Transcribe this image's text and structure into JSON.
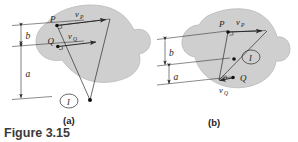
{
  "figure": {
    "caption": "Figure 3.15",
    "panels": [
      {
        "id": "a",
        "sublabel": "(a)",
        "points": [
          {
            "name": "P",
            "label": "P"
          },
          {
            "name": "Q",
            "label": "Q"
          }
        ],
        "vectors": [
          {
            "name": "vP",
            "base": "v",
            "subscript": "P"
          },
          {
            "name": "vQ",
            "base": "v",
            "subscript": "Q"
          }
        ],
        "dimensions": [
          {
            "name": "b",
            "label": "b"
          },
          {
            "name": "a",
            "label": "a"
          }
        ],
        "center": {
          "label": "I",
          "name": "instantaneous-center"
        }
      },
      {
        "id": "b",
        "sublabel": "(b)",
        "points": [
          {
            "name": "P",
            "label": "P"
          },
          {
            "name": "Q",
            "label": "Q"
          }
        ],
        "vectors": [
          {
            "name": "vP",
            "base": "v",
            "subscript": "P"
          },
          {
            "name": "vQ",
            "base": "v",
            "subscript": "Q"
          }
        ],
        "dimensions": [
          {
            "name": "b",
            "label": "b"
          },
          {
            "name": "a",
            "label": "a"
          }
        ],
        "center": {
          "label": "I",
          "name": "instantaneous-center"
        }
      }
    ],
    "colors": {
      "body_fill": "#cfcfcf",
      "body_stroke": "#b4b4b4",
      "line": "#2b2b2b",
      "caption": "#3a3a3a",
      "background": "#ffffff"
    }
  }
}
